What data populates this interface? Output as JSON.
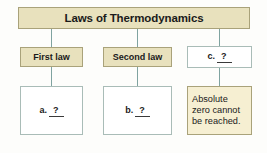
{
  "diagram": {
    "type": "flowchart",
    "title": "Laws of Thermodynamics",
    "colors": {
      "title_fill": "#e8e1bd",
      "branch_fill": "#e8e1bd",
      "answer_fill": "#f6efd2",
      "blank_fill": "#ffffff",
      "border": "#a9a27a",
      "connector": "#7fa3a0",
      "background": "#fdfdfb"
    },
    "root": {
      "label": "Laws of Thermodynamics"
    },
    "branches": [
      {
        "id": "first-law",
        "label": "First law",
        "style": "tan",
        "child": {
          "id": "a-blank",
          "style": "white",
          "marker": "a.",
          "value": "?"
        }
      },
      {
        "id": "second-law",
        "label": "Second law",
        "style": "tan",
        "child": {
          "id": "b-blank",
          "style": "white",
          "marker": "b.",
          "value": "?"
        }
      },
      {
        "id": "third-law",
        "marker": "c.",
        "value": "?",
        "style": "white",
        "child": {
          "id": "absolute-zero",
          "style": "cream",
          "text": "Absolute zero cannot be reached."
        }
      }
    ]
  }
}
